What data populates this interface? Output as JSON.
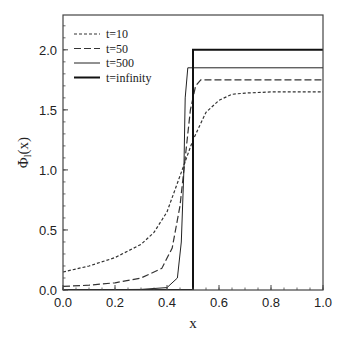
{
  "chart_data": {
    "type": "line",
    "title": "",
    "xlabel": "x",
    "ylabel": "Φ_l(x)",
    "xlim": [
      0.0,
      1.0
    ],
    "ylim": [
      0.0,
      2.29
    ],
    "xticks": [
      "0.0",
      "0.2",
      "0.4",
      "0.6",
      "0.8",
      "1.0"
    ],
    "yticks": [
      "0.0",
      "0.5",
      "1.0",
      "1.5",
      "2.0"
    ],
    "grid": false,
    "legend_position": "upper-left",
    "series": [
      {
        "name": "t=10",
        "style": "dotted",
        "x": [
          0.0,
          0.1,
          0.2,
          0.3,
          0.35,
          0.4,
          0.45,
          0.5,
          0.55,
          0.6,
          0.65,
          0.7,
          0.8,
          1.0
        ],
        "y": [
          0.15,
          0.2,
          0.27,
          0.38,
          0.48,
          0.65,
          0.95,
          1.25,
          1.48,
          1.58,
          1.63,
          1.64,
          1.65,
          1.65
        ]
      },
      {
        "name": "t=50",
        "style": "dashed",
        "x": [
          0.0,
          0.1,
          0.2,
          0.3,
          0.38,
          0.42,
          0.45,
          0.47,
          0.49,
          0.51,
          0.53,
          0.6,
          1.0
        ],
        "y": [
          0.03,
          0.04,
          0.06,
          0.1,
          0.18,
          0.35,
          0.7,
          1.1,
          1.5,
          1.7,
          1.75,
          1.75,
          1.75
        ]
      },
      {
        "name": "t=500",
        "style": "solid-thin",
        "x": [
          0.0,
          0.3,
          0.4,
          0.44,
          0.455,
          0.465,
          0.47,
          0.48,
          1.0
        ],
        "y": [
          0.0,
          0.005,
          0.02,
          0.1,
          0.4,
          1.0,
          1.6,
          1.85,
          1.85
        ]
      },
      {
        "name": "t=infinity",
        "style": "solid-thick",
        "x": [
          0.0,
          0.5,
          0.5,
          1.0
        ],
        "y": [
          0.0,
          0.0,
          2.0,
          2.0
        ]
      }
    ]
  }
}
